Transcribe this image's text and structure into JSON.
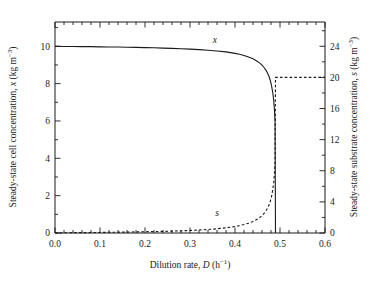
{
  "figure": {
    "name": "chemostat-steady-state-plot",
    "background": "#ffffff",
    "line_color": "#1a1a1a"
  },
  "axes": {
    "x": {
      "title_main": "Dilution rate, ",
      "title_symbol": "D",
      "title_units_open": " (h",
      "title_units_sup": "−1",
      "title_units_close": ")",
      "min": 0.0,
      "max": 0.6,
      "major_step": 0.1,
      "minor_step": 0.02,
      "ticks": [
        "0.0",
        "0.1",
        "0.2",
        "0.3",
        "0.4",
        "0.5",
        "0.6"
      ]
    },
    "y_left": {
      "title_main": "Steady-state cell concentration, ",
      "title_symbol": "x",
      "title_units_open": " (kg m",
      "title_units_sup": "−3",
      "title_units_close": ")",
      "min": 0,
      "max": 11.3,
      "major_step": 2,
      "minor_step": 1,
      "ticks": [
        "0",
        "2",
        "4",
        "6",
        "8",
        "10"
      ]
    },
    "y_right": {
      "title_main": "Steady-state substrate concentration, ",
      "title_symbol": "s",
      "title_units_open": " (kg m",
      "title_units_sup": "−3",
      "title_units_close": ")",
      "min": 0,
      "max": 27.12,
      "major_step": 4,
      "minor_step": 2,
      "ticks": [
        "0",
        "4",
        "8",
        "12",
        "16",
        "20",
        "24"
      ]
    }
  },
  "annotations": {
    "x_curve_label": "x",
    "s_curve_label": "s"
  },
  "chart_data": {
    "type": "line",
    "title": "",
    "xlabel": "Dilution rate, D (h−1)",
    "ylabel": "Steady-state cell concentration, x (kg m−3)",
    "ylabel_right": "Steady-state substrate concentration, s (kg m−3)",
    "xlim": [
      0.0,
      0.6
    ],
    "ylim_left": [
      0,
      11.3
    ],
    "ylim_right": [
      0,
      27.12
    ],
    "grid": false,
    "legend": "none",
    "critical_dilution_rate": 0.49,
    "feed_substrate_concentration": 20,
    "series": [
      {
        "name": "x",
        "axis": "left",
        "style": "solid",
        "label_at": {
          "x": 0.355,
          "y": 10.2
        },
        "x": [
          0.0,
          0.02,
          0.04,
          0.06,
          0.08,
          0.1,
          0.12,
          0.14,
          0.16,
          0.18,
          0.2,
          0.22,
          0.24,
          0.26,
          0.28,
          0.3,
          0.32,
          0.34,
          0.36,
          0.38,
          0.4,
          0.41,
          0.42,
          0.43,
          0.44,
          0.45,
          0.455,
          0.46,
          0.465,
          0.47,
          0.475,
          0.478,
          0.481,
          0.484,
          0.486,
          0.488,
          0.489,
          0.49
        ],
        "y": [
          10.0,
          9.99,
          9.99,
          9.98,
          9.98,
          9.97,
          9.96,
          9.96,
          9.95,
          9.94,
          9.93,
          9.92,
          9.9,
          9.89,
          9.87,
          9.85,
          9.82,
          9.79,
          9.75,
          9.7,
          9.62,
          9.57,
          9.51,
          9.43,
          9.33,
          9.19,
          9.1,
          8.99,
          8.85,
          8.67,
          8.42,
          8.21,
          7.92,
          7.5,
          7.1,
          6.5,
          5.9,
          0.0
        ]
      },
      {
        "name": "s",
        "axis": "right",
        "style": "dashed",
        "label_at": {
          "x": 0.36,
          "y": 2.2
        },
        "x": [
          0.0,
          0.02,
          0.04,
          0.06,
          0.08,
          0.1,
          0.12,
          0.14,
          0.16,
          0.18,
          0.2,
          0.22,
          0.24,
          0.26,
          0.28,
          0.3,
          0.32,
          0.34,
          0.36,
          0.38,
          0.4,
          0.41,
          0.42,
          0.43,
          0.44,
          0.45,
          0.455,
          0.46,
          0.465,
          0.47,
          0.475,
          0.478,
          0.481,
          0.484,
          0.486,
          0.488,
          0.489,
          0.49,
          0.49,
          0.52,
          0.55,
          0.58,
          0.6
        ],
        "y": [
          0.02,
          0.03,
          0.04,
          0.05,
          0.06,
          0.07,
          0.09,
          0.1,
          0.12,
          0.14,
          0.16,
          0.18,
          0.21,
          0.24,
          0.28,
          0.32,
          0.38,
          0.45,
          0.54,
          0.66,
          0.84,
          0.95,
          1.09,
          1.26,
          1.49,
          1.79,
          1.99,
          2.24,
          2.55,
          2.96,
          3.52,
          3.98,
          4.63,
          5.58,
          6.48,
          7.83,
          9.18,
          20.0,
          20.0,
          20.0,
          20.0,
          20.0,
          20.0
        ]
      }
    ]
  }
}
